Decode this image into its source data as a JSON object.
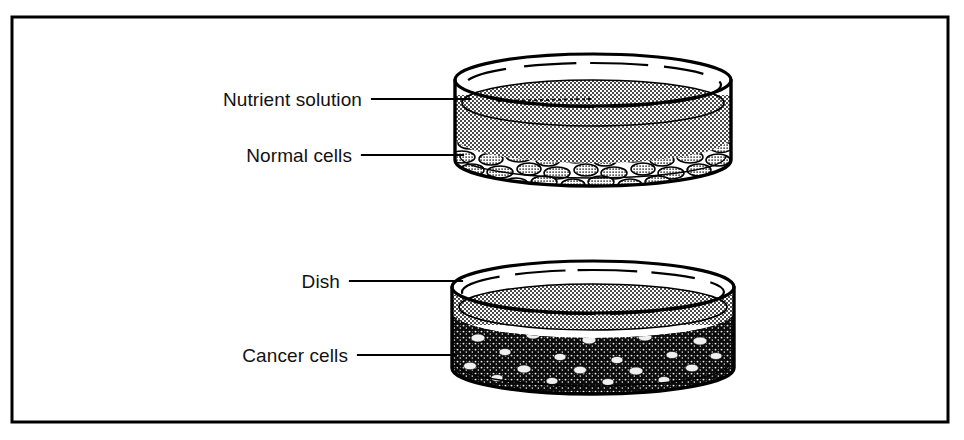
{
  "figure": {
    "background_color": "#ffffff",
    "ink_color": "#000000",
    "border": {
      "name": "figure-border",
      "x": 12,
      "y": 17,
      "width": 936,
      "height": 405,
      "stroke_width": 3
    }
  },
  "labels": {
    "nutrient_solution": "Nutrient solution",
    "normal_cells": "Normal cells",
    "dish": "Dish",
    "cancer_cells": "Cancer cells"
  },
  "leader_lines": [
    {
      "name": "leader-nutrient-solution",
      "x1": 372,
      "y1": 99,
      "x2": 470,
      "y2": 99
    },
    {
      "name": "leader-normal-cells",
      "x1": 362,
      "y1": 155,
      "x2": 463,
      "y2": 155
    },
    {
      "name": "leader-dish",
      "x1": 350,
      "y1": 281,
      "x2": 462,
      "y2": 281
    },
    {
      "name": "leader-cancer-cells",
      "x1": 358,
      "y1": 355,
      "x2": 456,
      "y2": 355
    }
  ],
  "dishes": [
    {
      "name": "top-dish",
      "contents": "normal cells",
      "cell_pattern": "ordered flat monolayer, cobblestone, single layer on dish floor",
      "fill_level": "cells occupy lower portion, nutrient solution above",
      "center_x": 593,
      "rim_center_y": 80,
      "rx": 138,
      "ry": 26,
      "body_height": 98,
      "solution_surface_y": 103,
      "cell_layer_top_y": 137
    },
    {
      "name": "bottom-dish",
      "contents": "cancer cells",
      "cell_pattern": "dense disordered multilayered mass, piled up",
      "fill_level": "cells fill nearly the whole dish, thin solution layer at top",
      "center_x": 593,
      "rim_center_y": 287,
      "rx": 141,
      "ry": 26,
      "body_height": 100,
      "solution_surface_y": 307,
      "cell_layer_top_y": 315
    }
  ],
  "colors": {
    "ink": "#000000",
    "paper": "#ffffff",
    "solution_halftone": "#8a8a8a",
    "cell_fill": "#d9d9d9",
    "cancer_mass": "#0b0b0b"
  }
}
